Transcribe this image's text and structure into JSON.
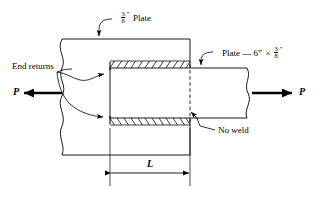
{
  "figure": {
    "type": "engineering-detail-drawing",
    "background_color": "#ffffff",
    "line_color": "#000000"
  },
  "labels": {
    "gusset_plate": {
      "fraction_numerator": "3",
      "fraction_denominator": "8",
      "inch_mark": "”",
      "text": "Plate",
      "full_text": "3/8” Plate"
    },
    "lap_plate": {
      "prefix": "Plate — 6”",
      "times": "×",
      "fraction_numerator": "3",
      "fraction_denominator": "8",
      "inch_mark": "”",
      "full_text": "Plate — 6” × 3/8”"
    },
    "end_returns": "End returns",
    "no_weld": "No weld",
    "force_left": "P",
    "force_right": "P",
    "dimension_length": "L"
  },
  "annotations": {
    "weld_top": "fillet-weld-hatching-top",
    "weld_bottom": "fillet-weld-hatching-bottom",
    "no_weld_line_style": "dashed",
    "break_line_style": "wavy-freehand-break"
  }
}
